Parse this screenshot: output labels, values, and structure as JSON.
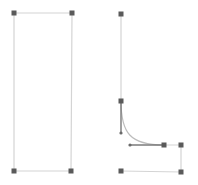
{
  "canvas": {
    "width": 198,
    "height": 185,
    "background": "#ffffff"
  },
  "colors": {
    "path_stroke": "#d4d4d4",
    "handle_fill": "#5a5a5a",
    "handle_line": "#7a7a7a",
    "curve_stroke": "#bdbdbd",
    "control_point": "#6a6a6a"
  },
  "shapes": {
    "left_rectangle": {
      "anchors": [
        [
          14,
          13
        ],
        [
          72,
          13
        ],
        [
          71,
          171
        ],
        [
          14,
          171
        ]
      ]
    },
    "right_path": {
      "anchors": [
        [
          121,
          14
        ],
        [
          121,
          101
        ],
        [
          164,
          145
        ],
        [
          181,
          145
        ],
        [
          181,
          172
        ],
        [
          121,
          171
        ]
      ],
      "curve": {
        "from": [
          121,
          101
        ],
        "c1": [
          121,
          133
        ],
        "c2": [
          130,
          145
        ],
        "to": [
          164,
          145
        ]
      },
      "handle_lines": [
        {
          "from": [
            121,
            101
          ],
          "to": [
            121,
            133
          ]
        },
        {
          "from": [
            130,
            145
          ],
          "to": [
            164,
            145
          ]
        }
      ],
      "control_points": [
        [
          121,
          133
        ],
        [
          130,
          145
        ]
      ]
    }
  }
}
